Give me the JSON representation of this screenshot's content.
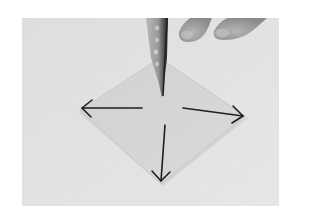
{
  "image": {
    "description": "Grayscale instructional photo of an origami step: a square sheet of paper in diamond orientation, a finger pressing the center, and four arrows pointing outward toward the left, right and bottom corners.",
    "colors": {
      "page_background": "#ffffff",
      "photo_background": "#e3e3e3",
      "paper": "#d5d5d5",
      "paper_shadow": "#c4c4c4",
      "arrow": "#1e1e1e",
      "finger": "#a8a8a8",
      "finger_edge": "#3a3a3a",
      "fingertips": "#9e9e9e"
    },
    "arrows": [
      {
        "name": "left",
        "direction": "left"
      },
      {
        "name": "right",
        "direction": "right"
      },
      {
        "name": "down",
        "direction": "down"
      }
    ]
  }
}
